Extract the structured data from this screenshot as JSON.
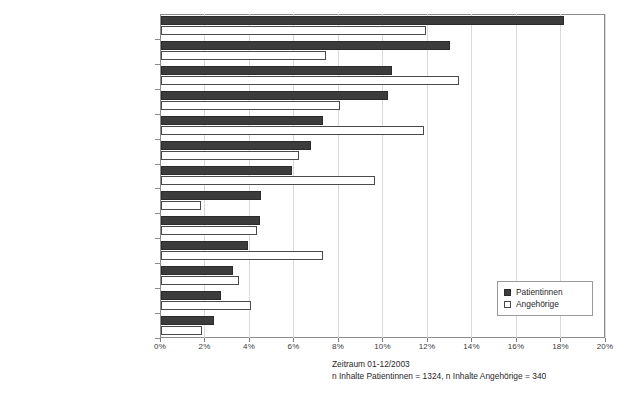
{
  "chart_data": {
    "type": "bar",
    "orientation": "horizontal",
    "title": "",
    "xlabel": "",
    "ylabel": "",
    "xlim": [
      0,
      20
    ],
    "xunit": "%",
    "xticks": [
      "0%",
      "2%",
      "4%",
      "6%",
      "8%",
      "10%",
      "12%",
      "14%",
      "16%",
      "18%",
      "20%"
    ],
    "xtick_values": [
      0,
      2,
      4,
      6,
      8,
      10,
      12,
      14,
      16,
      18,
      20
    ],
    "grid": true,
    "legend_position": "bottom-right",
    "categories": [
      "Hormontherapie",
      "Nebenwirkungen",
      "Chemotherapie",
      "Behandlungsalternative",
      "Behandlungsstandards",
      "Strahlentherapie",
      "neue/experimentelle Methoden",
      "Behandlung von Therapiefolgen",
      "Operation",
      "Behandlungsalternative",
      "Supportive Maßnahmen",
      "Zweite medizinische Meinung",
      "spezielle Medikamente"
    ],
    "series": [
      {
        "name": "Patientinnen",
        "color": "#3c3c3c",
        "values": [
          18.1,
          13.0,
          10.4,
          10.2,
          7.3,
          6.75,
          5.9,
          4.5,
          4.45,
          3.9,
          3.25,
          2.7,
          2.4
        ]
      },
      {
        "name": "Angehörige",
        "color": "#ffffff",
        "values": [
          11.9,
          7.4,
          13.4,
          8.05,
          11.8,
          6.2,
          9.6,
          1.8,
          4.3,
          7.3,
          3.5,
          4.05,
          1.85
        ]
      }
    ],
    "annotations": [
      "Zeitraum 01-12/2003",
      "n Inhalte Patientinnen = 1324, n Inhalte Angehörige = 340"
    ]
  },
  "legend": {
    "items": [
      {
        "label": "Patientinnen"
      },
      {
        "label": "Angehörige"
      }
    ]
  },
  "caption": {
    "line1": "Zeitraum 01-12/2003",
    "line2": "n Inhalte Patientinnen = 1324, n Inhalte Angehörige = 340"
  }
}
